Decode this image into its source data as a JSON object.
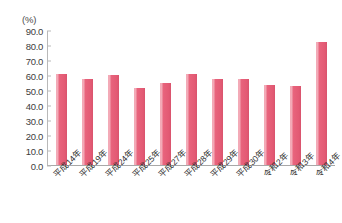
{
  "chart_data": {
    "type": "bar",
    "title": "",
    "xlabel": "",
    "ylabel": "",
    "unit_label": "(%)",
    "categories": [
      "平成14年",
      "平成19年",
      "平成24年",
      "平成25年",
      "平成27年",
      "平成28年",
      "平成29年",
      "平成30年",
      "令和2年",
      "令和3年",
      "令和4年"
    ],
    "values": [
      60.7,
      57.5,
      60.0,
      51.3,
      54.5,
      60.5,
      57.5,
      57.5,
      53.5,
      52.5,
      82.0
    ],
    "ylim": [
      0.0,
      90.0
    ],
    "yticks": [
      "0.0",
      "10.0",
      "20.0",
      "30.0",
      "40.0",
      "50.0",
      "60.0",
      "70.0",
      "80.0",
      "90.0"
    ],
    "ytick_values": [
      0.0,
      10.0,
      20.0,
      30.0,
      40.0,
      50.0,
      60.0,
      70.0,
      80.0,
      90.0
    ],
    "grid": false,
    "legend": [],
    "legend_position": "none",
    "bar_color": "#e8637c",
    "axis_color": "#b9b9b9",
    "text_color": "#2e2e2e"
  }
}
